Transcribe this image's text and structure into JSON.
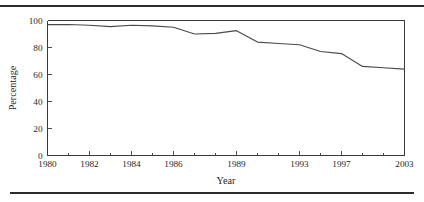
{
  "figure": {
    "top_rule": "top-divider",
    "bottom_rule": "bottom-divider"
  },
  "chart_data": {
    "type": "line",
    "title": "",
    "xlabel": "Year",
    "ylabel": "Percentage",
    "ylim": [
      0,
      100
    ],
    "yticks": [
      0,
      20,
      40,
      60,
      80,
      100
    ],
    "ytick_labels": [
      "0",
      "20",
      "40",
      "60",
      "80",
      "100"
    ],
    "x_axis_kind": "ordinal",
    "categories": [
      "1980",
      "1981",
      "1982",
      "1983",
      "1984",
      "1985",
      "1986",
      "1987",
      "1988",
      "1989",
      "1990",
      "1991",
      "1993",
      "1995",
      "1997",
      "1999",
      "2001",
      "2003"
    ],
    "xtick_labels": [
      "1980",
      "",
      "1982",
      "",
      "1984",
      "",
      "1986",
      "",
      "",
      "1989",
      "",
      "",
      "1993",
      "",
      "1997",
      "",
      "",
      "2003"
    ],
    "xtick_labels_major": [
      "1980",
      "1982",
      "1984",
      "1986",
      "1989",
      "1993",
      "1997",
      "2003"
    ],
    "grid": false,
    "legend": null,
    "series": [
      {
        "name": "Percentage",
        "values": [
          97,
          97,
          96.5,
          95.5,
          96.5,
          96,
          95,
          90,
          90.5,
          92.5,
          84,
          83,
          82,
          77,
          75.5,
          66,
          65,
          64
        ]
      }
    ],
    "values": [
      97,
      97,
      96.5,
      95.5,
      96.5,
      96,
      95,
      90,
      90.5,
      92.5,
      84,
      83,
      82,
      77,
      75.5,
      66,
      65,
      64
    ],
    "line_color": "#4a4a4a",
    "axis_color": "#3a3a3a"
  }
}
